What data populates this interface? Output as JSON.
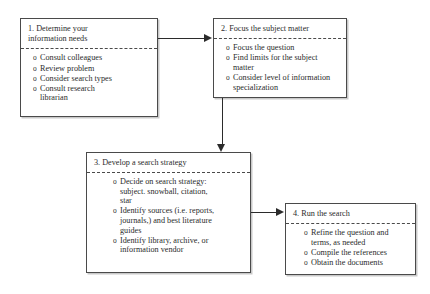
{
  "diagram": {
    "type": "flowchart",
    "orientation": "left-to-right then down then left-to-right",
    "colors": {
      "box_border": "#4a4a4a",
      "box_fill": "#ffffff",
      "connector": "#2b2b2b",
      "text": "#2b2b2b",
      "shadow": "#c9c9c9"
    },
    "nodes": [
      {
        "id": "node-1",
        "title": "1.  Determine your\n      information  needs",
        "bullet_mark": "o",
        "bullets": [
          "Consult colleagues",
          "Review problem",
          "Consider search types",
          "Consult research\nlibrarian"
        ]
      },
      {
        "id": "node-2",
        "title": "2.  Focus the subject matter",
        "bullet_mark": "o",
        "bullets": [
          "Focus the question",
          "Find limits for the subject\nmatter",
          "Consider level of information\nspecialization"
        ]
      },
      {
        "id": "node-3",
        "title": "3.  Develop a search strategy",
        "bullet_mark": "o",
        "bullets": [
          "Decide on search strategy:\nsubject. snowball, citation,\nstar",
          "Identify sources (i.e. reports,\njournals,) and best literature\nguides",
          "Identify library, archive, or\ninformation vendor"
        ]
      },
      {
        "id": "node-4",
        "title": "4.  Run the search",
        "bullet_mark": "o",
        "bullets": [
          "Refine the question and\nterms, as needed",
          "Compile the references",
          "Obtain the documents"
        ]
      }
    ],
    "connectors": [
      {
        "id": "conn-1-2",
        "from": "node-1",
        "to": "node-2",
        "direction": "right"
      },
      {
        "id": "conn-2-3",
        "from": "node-2",
        "to": "node-3",
        "direction": "down"
      },
      {
        "id": "conn-3-4",
        "from": "node-3",
        "to": "node-4",
        "direction": "right"
      }
    ]
  }
}
